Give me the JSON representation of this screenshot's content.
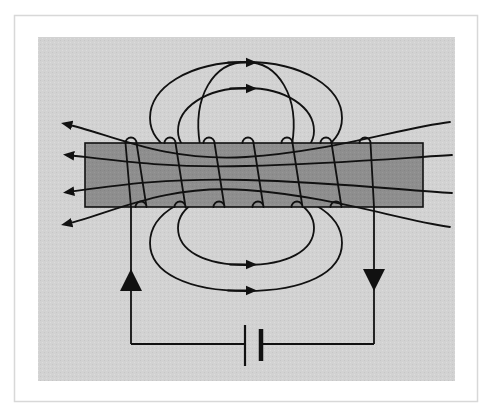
{
  "figure": {
    "kind": "physics-diagram",
    "caption": "",
    "colors": {
      "page_background": "#ffffff",
      "outer_frame_line": "#d8d8d8",
      "panel_background": "#d2d2d2",
      "core_bar_fill": "#8e8e8e",
      "ink": "#111111"
    },
    "frame": {
      "outer_rule": {
        "x": 14,
        "y": 15,
        "width": 463,
        "height": 386,
        "stroke_width": 1.5
      },
      "panel": {
        "x": 38,
        "y": 37,
        "width": 417,
        "height": 344
      }
    },
    "core_bar": {
      "label": "iron-core-bar",
      "x": 85,
      "y": 143,
      "width": 338,
      "height": 64,
      "fill": "#8e8e8e",
      "stroke": "#111111",
      "stroke_width": 1.6
    },
    "coil": {
      "label": "wire-coil-windings",
      "turn_count": 7,
      "top_loop_count": 7,
      "bottom_loop_count": 6,
      "top_loop_x": [
        131,
        170,
        209,
        248,
        287,
        326,
        365
      ],
      "bottom_loop_x": [
        141,
        180,
        219,
        258,
        297,
        336
      ],
      "top_loop_y": 143,
      "bottom_loop_y": 207,
      "loop_radius": 5.5,
      "stroke_width": 1.8
    },
    "field_lines": {
      "label": "magnetic-field-lines",
      "top_loops": 2,
      "bottom_loops": 2,
      "through_lines": 4,
      "arrow_direction_top": "right",
      "arrow_direction_bottom": "right",
      "arrow_direction_through": "left",
      "left_arrowheads": 4,
      "right_arrowheads": 0,
      "stroke_width": 1.8
    },
    "circuit": {
      "label": "battery-circuit",
      "left_wire_x": 131,
      "right_wire_x": 374,
      "bottom_wire_y": 344,
      "wire_top_y": 207,
      "stroke_width": 1.8,
      "current_arrows": [
        {
          "name": "left-current-arrow",
          "direction": "up",
          "x": 131,
          "y": 280
        },
        {
          "name": "right-current-arrow",
          "direction": "down",
          "x": 374,
          "y": 280
        }
      ],
      "battery": {
        "label": "battery-cell",
        "center_x": 252,
        "center_y": 344,
        "long_plate": {
          "x": 245,
          "y_top": 325,
          "y_bottom": 366,
          "thickness": 2.2,
          "side": "left"
        },
        "short_plate": {
          "x": 261,
          "y_top": 329,
          "y_bottom": 361,
          "thickness": 4.5,
          "side": "right"
        }
      }
    }
  }
}
